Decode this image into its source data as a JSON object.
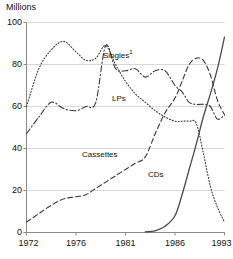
{
  "chart_data": {
    "type": "line",
    "title": "",
    "ylabel": "Millions",
    "xlabel": "",
    "ylim": [
      0,
      100
    ],
    "xlim": [
      1972,
      1993
    ],
    "grid": true,
    "legend_position": "inline-annotations",
    "yticks": [
      0,
      20,
      40,
      60,
      80,
      100
    ],
    "ytick_labels": [
      "0",
      "20",
      "40",
      "60",
      "80",
      "100"
    ],
    "xticks": [
      1972,
      1976,
      1981,
      1986,
      1993
    ],
    "xtick_labels": [
      "1972",
      "1976",
      "1981",
      "1986",
      "1993"
    ],
    "series": [
      {
        "name": "Singles",
        "label": "Singles",
        "label_superscript": "1",
        "style": "dash-dot",
        "color": "#3a3a3a",
        "x": [
          1972,
          1973,
          1974,
          1975,
          1976,
          1977,
          1978,
          1979,
          1980,
          1981,
          1982,
          1983,
          1984,
          1985,
          1986,
          1987,
          1988,
          1989,
          1990,
          1991,
          1992,
          1993
        ],
        "values": [
          47,
          55,
          62,
          59,
          58,
          60,
          62,
          89,
          78,
          77,
          78,
          74,
          77,
          77,
          70,
          67,
          62,
          61,
          61,
          60,
          54,
          56
        ]
      },
      {
        "name": "LPs",
        "label": "LPs",
        "label_superscript": "",
        "style": "dotted",
        "color": "#3a3a3a",
        "x": [
          1972,
          1973,
          1974,
          1975,
          1976,
          1977,
          1978,
          1979,
          1980,
          1981,
          1982,
          1983,
          1984,
          1985,
          1986,
          1987,
          1988,
          1989,
          1990,
          1991,
          1992,
          1993
        ],
        "values": [
          60,
          78,
          87,
          91,
          86,
          82,
          83,
          89,
          80,
          72,
          66,
          62,
          58,
          55,
          53,
          53,
          53,
          52,
          38,
          22,
          12,
          5
        ]
      },
      {
        "name": "Cassettes",
        "label": "Cassettes",
        "label_superscript": "",
        "style": "dashed",
        "color": "#3a3a3a",
        "x": [
          1972,
          1973,
          1974,
          1975,
          1976,
          1977,
          1978,
          1979,
          1980,
          1981,
          1982,
          1983,
          1984,
          1985,
          1986,
          1987,
          1988,
          1989,
          1990,
          1991,
          1992,
          1993
        ],
        "values": [
          5,
          9,
          13,
          16,
          17,
          18,
          21,
          24,
          27,
          30,
          33,
          36,
          47,
          57,
          64,
          72,
          80,
          83,
          82,
          75,
          63,
          56
        ]
      },
      {
        "name": "CDs",
        "label": "CDs",
        "label_superscript": "",
        "style": "solid",
        "color": "#4a4a4a",
        "x": [
          1983,
          1984,
          1985,
          1986,
          1987,
          1988,
          1989,
          1990,
          1991,
          1992,
          1993
        ],
        "values": [
          0.3,
          0.8,
          3,
          8,
          18,
          30,
          42,
          55,
          66,
          78,
          93
        ]
      }
    ],
    "annotations": [
      {
        "text": "Singles",
        "superscript": "1",
        "series": "Singles"
      },
      {
        "text": "LPs",
        "superscript": "",
        "series": "LPs"
      },
      {
        "text": "Cassettes",
        "superscript": "",
        "series": "Cassettes"
      },
      {
        "text": "CDs",
        "superscript": "",
        "series": "CDs"
      }
    ],
    "colors": {
      "axis": "#8a8a8a",
      "grid": "#d8d8d8",
      "text": "#111111",
      "line": "#3a3a3a",
      "background": "#ffffff"
    }
  }
}
